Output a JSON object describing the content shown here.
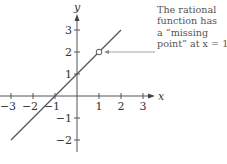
{
  "chart_data": {
    "type": "line",
    "title": "",
    "xlabel": "x",
    "ylabel": "y",
    "xlim": [
      -3,
      3
    ],
    "ylim": [
      -2,
      3
    ],
    "grid": false,
    "x_ticks": [
      -3,
      -2,
      -1,
      1,
      2,
      3
    ],
    "y_ticks": [
      -2,
      -1,
      1,
      2,
      3
    ],
    "x_tick_labels": [
      "−3",
      "−2",
      "−1",
      "1",
      "2",
      "3"
    ],
    "y_tick_labels": [
      "−2",
      "−1",
      "1",
      "2",
      "3"
    ],
    "series": [
      {
        "name": "y = x + 1",
        "x": [
          -3,
          2
        ],
        "y": [
          -2,
          3
        ],
        "color": "#555555"
      }
    ],
    "missing_point": {
      "x": 1,
      "y": 2,
      "marker": "open-circle"
    },
    "annotation": {
      "lines": [
        "The rational",
        "function has",
        "a “missing",
        "point” at x = 1."
      ],
      "points_to": {
        "x": 1,
        "y": 2
      }
    }
  },
  "axes": {
    "x_label": "x",
    "y_label": "y"
  },
  "annotation": {
    "line1": "The rational",
    "line2": "function has",
    "line3": "a “missing",
    "line4": "point” at x = 1."
  },
  "colors": {
    "axis": "#555555",
    "line": "#555555",
    "text": "#333333",
    "leader": "#999999"
  }
}
